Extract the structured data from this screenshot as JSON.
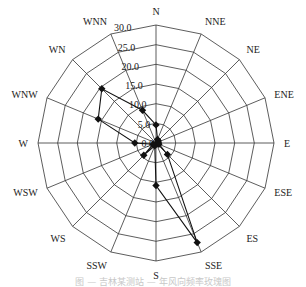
{
  "chart_data": {
    "type": "radar",
    "title": "",
    "categories": [
      "N",
      "NNE",
      "NE",
      "ENE",
      "E",
      "ESE",
      "ES",
      "SSE",
      "S",
      "SSW",
      "WS",
      "WSW",
      "W",
      "WNW",
      "WN",
      "WNN"
    ],
    "series": [
      {
        "name": "wind frequency",
        "values": [
          4.6,
          1.0,
          0.8,
          0.6,
          0.6,
          0.8,
          4.1,
          27.4,
          10.8,
          0.8,
          4.4,
          0.8,
          5.4,
          15.9,
          19.5,
          9.0
        ]
      }
    ],
    "radial_ticks": [
      "0.0",
      "5.0",
      "10.0",
      "15.0",
      "20.0",
      "25.0",
      "30.0"
    ],
    "rlim": [
      0,
      30
    ],
    "grid": true,
    "legend": "none"
  },
  "caption": "图 — 吉林某测站 — 年风向频率玫瑰图",
  "colors": {
    "grid": "#333333",
    "series": "#111111",
    "label": "#222222"
  }
}
